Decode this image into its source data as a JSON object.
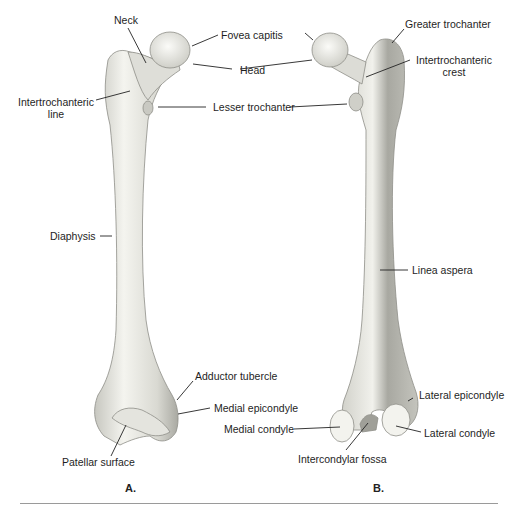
{
  "figure": {
    "panels": [
      {
        "id": "A",
        "caption": "A.",
        "view": "anterior",
        "labels": {
          "neck": "Neck",
          "fovea_capitis": "Fovea capitis",
          "head": "Head",
          "intertrochanteric_line": "Intertrochanteric line",
          "lesser_trochanter": "Lesser trochanter",
          "diaphysis": "Diaphysis",
          "adductor_tubercle": "Adductor tubercle",
          "medial_epicondyle": "Medial epicondyle",
          "patellar_surface": "Patellar surface"
        }
      },
      {
        "id": "B",
        "caption": "B.",
        "view": "posterior",
        "labels": {
          "greater_trochanter": "Greater trochanter",
          "intertrochanteric_crest": "Intertrochanteric crest",
          "linea_aspera": "Linea aspera",
          "lateral_epicondyle": "Lateral epicondyle",
          "medial_condyle": "Medial condyle",
          "lateral_condyle": "Lateral condyle",
          "intercondylar_fossa": "Intercondylar fossa"
        }
      }
    ],
    "colors": {
      "bone_light": "#efefea",
      "bone_shade": "#b9b9b2",
      "leader_line": "#222222",
      "rule": "#9a9a9a"
    }
  }
}
